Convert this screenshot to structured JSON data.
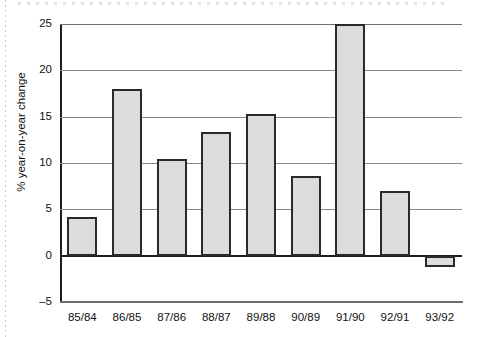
{
  "chart_data": {
    "type": "bar",
    "title": "",
    "xlabel": "",
    "ylabel": "% year-on-year change",
    "categories": [
      "85/84",
      "86/85",
      "87/86",
      "88/87",
      "89/88",
      "90/89",
      "91/90",
      "92/91",
      "93/92"
    ],
    "values": [
      4.2,
      18.0,
      10.4,
      13.3,
      15.3,
      8.6,
      25.0,
      7.0,
      -1.2
    ],
    "ylim": [
      -5,
      25
    ],
    "yticks": [
      -5,
      0,
      5,
      10,
      15,
      20,
      25
    ],
    "ytick_labels": [
      "–5",
      "0",
      "5",
      "10",
      "15",
      "20",
      "25"
    ],
    "grid": true,
    "legend": "none",
    "bar_fill_color": "#dcdcdc",
    "bar_border_color": "#2a2a2a",
    "gridline_color": "#8a8a8a",
    "zero_line_color": "#1d1d1d"
  }
}
